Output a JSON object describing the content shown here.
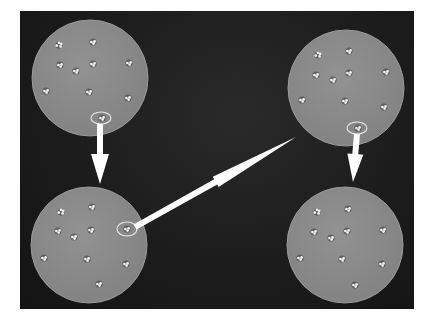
{
  "figure": {
    "colors": {
      "page_background": "#ffffff",
      "panel_background": "#1c1c1c",
      "plate_fill": "#8a8a8a",
      "plate_edge": "#9a9a9a",
      "colony": "#f2f2f2",
      "colony_shadow": "#3a3a3a",
      "arrow": "#ffffff",
      "highlight_ring": "#e8e8e8"
    },
    "plates": [
      {
        "id": "top-left",
        "cx": 90,
        "cy": 78,
        "r": 58,
        "colonies": [
          [
            59,
            45,
            "triple"
          ],
          [
            93,
            42,
            "pair"
          ],
          [
            60,
            65,
            "pair"
          ],
          [
            76,
            71,
            "pair"
          ],
          [
            93,
            64,
            "pair"
          ],
          [
            129,
            63,
            "pair"
          ],
          [
            46,
            91,
            "pair"
          ],
          [
            89,
            92,
            "pair"
          ],
          [
            128,
            98,
            "pair"
          ]
        ],
        "highlight": {
          "cx": 101,
          "cy": 118,
          "rx": 10,
          "ry": 6
        }
      },
      {
        "id": "top-right",
        "cx": 346,
        "cy": 88,
        "r": 58,
        "colonies": [
          [
            318,
            55,
            "triple"
          ],
          [
            349,
            51,
            "pair"
          ],
          [
            316,
            75,
            "pair"
          ],
          [
            333,
            80,
            "pair"
          ],
          [
            349,
            73,
            "pair"
          ],
          [
            386,
            72,
            "pair"
          ],
          [
            302,
            100,
            "pair"
          ],
          [
            345,
            101,
            "pair"
          ],
          [
            384,
            107,
            "pair"
          ]
        ],
        "highlight": {
          "cx": 357,
          "cy": 128,
          "rx": 10,
          "ry": 6
        }
      },
      {
        "id": "bottom-left",
        "cx": 89,
        "cy": 245,
        "r": 58,
        "colonies": [
          [
            61,
            212,
            "triple"
          ],
          [
            92,
            207,
            "pair"
          ],
          [
            58,
            231,
            "pair"
          ],
          [
            74,
            237,
            "pair"
          ],
          [
            91,
            230,
            "pair"
          ],
          [
            44,
            258,
            "pair"
          ],
          [
            87,
            259,
            "pair"
          ],
          [
            126,
            264,
            "pair"
          ],
          [
            99,
            284,
            "pair"
          ]
        ],
        "highlight": {
          "cx": 127,
          "cy": 229,
          "rx": 10,
          "ry": 7
        },
        "selected_colony": [
          127,
          229,
          "pair"
        ]
      },
      {
        "id": "bottom-right",
        "cx": 345,
        "cy": 245,
        "r": 58,
        "colonies": [
          [
            317,
            212,
            "triple"
          ],
          [
            348,
            209,
            "pair"
          ],
          [
            314,
            232,
            "pair"
          ],
          [
            331,
            238,
            "pair"
          ],
          [
            347,
            231,
            "pair"
          ],
          [
            383,
            230,
            "pair"
          ],
          [
            300,
            258,
            "pair"
          ],
          [
            342,
            259,
            "pair"
          ],
          [
            382,
            264,
            "pair"
          ],
          [
            355,
            285,
            "pair"
          ]
        ]
      }
    ],
    "arrows": [
      {
        "id": "arrow-down-left",
        "from": [
          100,
          124
        ],
        "to": [
          100,
          184
        ],
        "shaft_width": 6,
        "head_width": 18,
        "head_length": 30
      },
      {
        "id": "arrow-diagonal",
        "from": [
          135,
          227
        ],
        "to": [
          296,
          137
        ],
        "shaft_width": 6,
        "head_width": 12,
        "head_length": 92
      },
      {
        "id": "arrow-down-right",
        "from": [
          357,
          134
        ],
        "to": [
          353,
          182
        ],
        "shaft_width": 6,
        "head_width": 16,
        "head_length": 28
      }
    ]
  }
}
